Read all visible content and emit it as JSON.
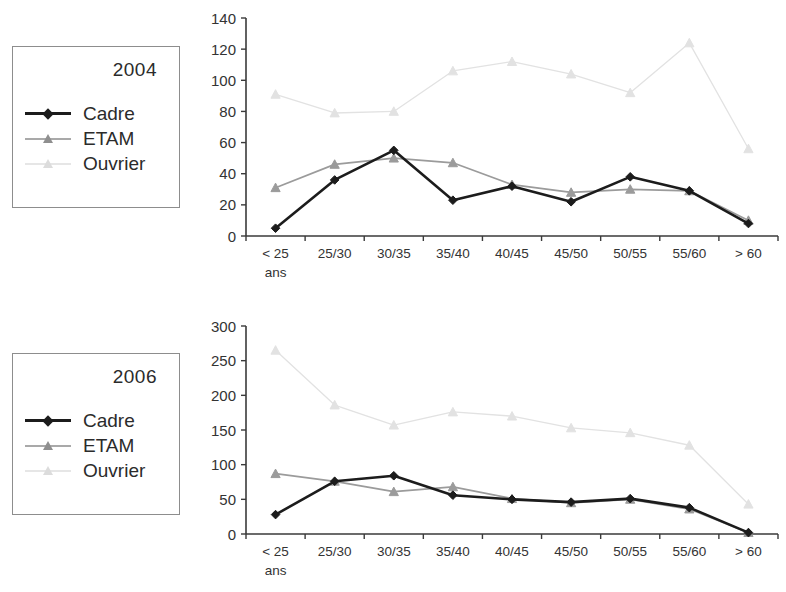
{
  "figure": {
    "panels": [
      {
        "id": "panel-2004",
        "legend": {
          "title": "2004",
          "entries": [
            {
              "label": "Cadre",
              "color": "#1c1c1c",
              "marker": "diamond"
            },
            {
              "label": "ETAM",
              "color": "#9b9b9b",
              "marker": "triangle"
            },
            {
              "label": "Ouvrier",
              "color": "#e2e2e2",
              "marker": "triangle"
            }
          ]
        }
      },
      {
        "id": "panel-2006",
        "legend": {
          "title": "2006",
          "entries": [
            {
              "label": "Cadre",
              "color": "#1c1c1c",
              "marker": "diamond"
            },
            {
              "label": "ETAM",
              "color": "#9b9b9b",
              "marker": "triangle"
            },
            {
              "label": "Ouvrier",
              "color": "#e2e2e2",
              "marker": "triangle"
            }
          ]
        }
      }
    ]
  },
  "chart_data": [
    {
      "type": "line",
      "title": "2004",
      "xlabel": "ans",
      "ylabel": "",
      "categories": [
        "< 25",
        "25/30",
        "30/35",
        "35/40",
        "40/45",
        "45/50",
        "50/55",
        "55/60",
        "> 60"
      ],
      "xtick_labels": [
        "< 25",
        "25/30",
        "30/35",
        "35/40",
        "40/45",
        "45/50",
        "50/55",
        "55/60",
        "> 60"
      ],
      "xtick_sublabel": "ans",
      "ytick_labels": [
        "0",
        "20",
        "40",
        "60",
        "80",
        "100",
        "120",
        "140"
      ],
      "yticks": [
        0,
        20,
        40,
        60,
        80,
        100,
        120,
        140
      ],
      "ylim": [
        0,
        140
      ],
      "grid": false,
      "legend_position": "outside-left",
      "series": [
        {
          "name": "Cadre",
          "color": "#1c1c1c",
          "marker": "diamond",
          "values": [
            5,
            36,
            55,
            23,
            32,
            22,
            38,
            29,
            8
          ]
        },
        {
          "name": "ETAM",
          "color": "#9b9b9b",
          "marker": "triangle",
          "values": [
            31,
            46,
            50,
            47,
            33,
            28,
            30,
            29,
            10
          ]
        },
        {
          "name": "Ouvrier",
          "color": "#e2e2e2",
          "marker": "triangle",
          "values": [
            91,
            79,
            80,
            106,
            112,
            104,
            92,
            124,
            56
          ]
        }
      ]
    },
    {
      "type": "line",
      "title": "2006",
      "xlabel": "ans",
      "ylabel": "",
      "categories": [
        "< 25",
        "25/30",
        "30/35",
        "35/40",
        "40/45",
        "45/50",
        "50/55",
        "55/60",
        "> 60"
      ],
      "xtick_labels": [
        "< 25",
        "25/30",
        "30/35",
        "35/40",
        "40/45",
        "45/50",
        "50/55",
        "55/60",
        "> 60"
      ],
      "xtick_sublabel": "ans",
      "ytick_labels": [
        "0",
        "50",
        "100",
        "150",
        "200",
        "250",
        "300"
      ],
      "yticks": [
        0,
        50,
        100,
        150,
        200,
        250,
        300
      ],
      "ylim": [
        0,
        300
      ],
      "grid": false,
      "legend_position": "outside-left",
      "series": [
        {
          "name": "Cadre",
          "color": "#1c1c1c",
          "marker": "diamond",
          "values": [
            28,
            76,
            84,
            56,
            50,
            46,
            51,
            38,
            2
          ]
        },
        {
          "name": "ETAM",
          "color": "#9b9b9b",
          "marker": "triangle",
          "values": [
            87,
            76,
            61,
            68,
            51,
            45,
            50,
            36,
            2
          ]
        },
        {
          "name": "Ouvrier",
          "color": "#e2e2e2",
          "marker": "triangle",
          "values": [
            265,
            186,
            157,
            176,
            170,
            153,
            146,
            128,
            43
          ]
        }
      ]
    }
  ]
}
